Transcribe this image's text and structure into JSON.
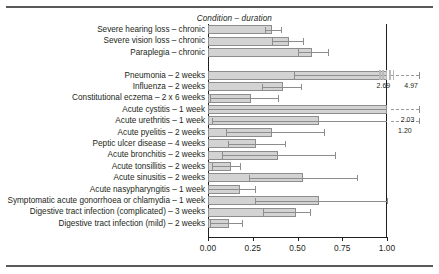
{
  "figure": {
    "title": "Condition – duration",
    "top_rule": true,
    "bottom_rule": true
  },
  "axis": {
    "ticks": [
      "0.00",
      "0.25",
      "0.50",
      "0.75",
      "1.00"
    ],
    "tick_values": [
      0.0,
      0.25,
      0.5,
      0.75,
      1.0
    ],
    "xmin": 0.0,
    "xmax": 1.0
  },
  "colors": {
    "bar_fill": "#d3d3d3",
    "bar_edge": "#8d8d8d",
    "axis": "#231f20",
    "rule": "#58595b",
    "text": "#231f20"
  },
  "chart_data": {
    "type": "bar",
    "orientation": "horizontal",
    "title": "Condition – duration",
    "xlabel": "",
    "ylabel": "",
    "xlim": [
      0.0,
      1.0
    ],
    "grid": false,
    "legend": null,
    "error_bars": "horizontal ranges with end caps",
    "categories": [
      "Severe hearing loss – chronic",
      "Severe vision loss – chronic",
      "Paraplegia – chronic",
      "",
      "Pneumonia – 2 weeks",
      "Influenza – 2 weeks",
      "Constitutional eczema – 2 x 6 weeks",
      "Acute cystitis – 1 week",
      "Acute urethritis – 1 week",
      "Acute pyelitis – 2 weeks",
      "Peptic ulcer disease – 4 weeks",
      "Acute bronchitis – 2 weeks",
      "Acute tonsillitis – 2 weeks",
      "Acute sinusitis – 2 weeks",
      "Acute nasypharyngitis – 1 week",
      "Symptomatic acute gonorrhoea or chlamydia – 1 week",
      "Digestive tract infection (complicated) – 3 weeks",
      "Digestive tract infection (mild) – 2 weeks"
    ],
    "values": [
      0.36,
      0.45,
      0.58,
      null,
      1.0,
      0.42,
      0.24,
      1.0,
      0.62,
      0.36,
      0.27,
      0.39,
      0.13,
      0.53,
      0.18,
      0.62,
      0.49,
      0.12
    ],
    "errors_low": [
      0.32,
      0.36,
      0.5,
      null,
      0.48,
      0.3,
      0.01,
      0.0,
      0.02,
      0.1,
      0.11,
      0.08,
      0.02,
      0.23,
      0.0,
      0.26,
      0.31,
      0.01
    ],
    "errors_high": [
      0.41,
      0.53,
      0.67,
      null,
      4.97,
      0.52,
      0.39,
      2.03,
      1.2,
      0.65,
      0.43,
      0.71,
      0.18,
      0.83,
      0.26,
      1.0,
      0.57,
      0.19
    ],
    "overflow_labels": [
      {
        "row": 4,
        "label": "2.69",
        "x": 0.98
      },
      {
        "row": 4,
        "label": "4.97",
        "x": 1.135
      },
      {
        "row": 7,
        "label": "2.03",
        "x": 1.115
      },
      {
        "row": 8,
        "label": "1.20",
        "x": 1.1
      }
    ]
  }
}
